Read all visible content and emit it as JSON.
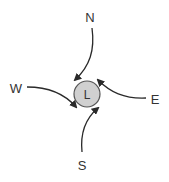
{
  "diagram": {
    "center": {
      "label": "L",
      "fill": "#d0d0d0",
      "stroke": "#555555"
    },
    "directions": {
      "north": {
        "label": "N"
      },
      "south": {
        "label": "S"
      },
      "east": {
        "label": "E"
      },
      "west": {
        "label": "W"
      }
    },
    "arrow_color": "#2a2a2a"
  }
}
